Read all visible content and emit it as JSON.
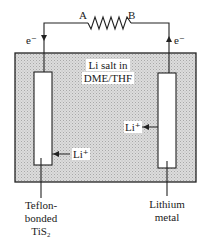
{
  "diagram": {
    "circuit": {
      "resistor_terminal_a": "A",
      "resistor_terminal_b": "B",
      "electron_left": "e⁻",
      "electron_right": "e⁻"
    },
    "electrolyte": {
      "line1": "Li salt in",
      "line2": "DME/THF"
    },
    "ions": {
      "left_ion": "Li⁺",
      "right_ion": "Li⁺"
    },
    "electrodes": {
      "left": {
        "line1": "Teflon-",
        "line2": "bonded",
        "line3": "TiS₂"
      },
      "right": {
        "line1": "Lithium",
        "line2": "metal"
      }
    },
    "colors": {
      "electrolyte_fill": "#d4d4d4",
      "line": "#222222",
      "electrode_fill": "#ffffff"
    }
  }
}
